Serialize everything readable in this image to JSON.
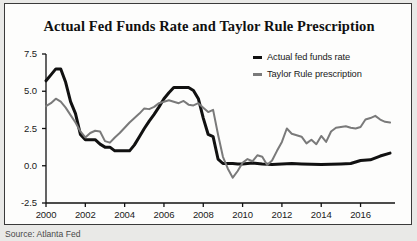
{
  "figure": {
    "title": "Actual Fed Funds Rate and Taylor Rule Prescription",
    "source": "Source: Atlanta Fed",
    "background_color": "#e9e9e7",
    "panel_color": "#fdfdfc",
    "border_color": "#3a3a3a"
  },
  "legend": {
    "position": "top-right",
    "entries": [
      {
        "label": "Actual fed funds rate",
        "color": "#111111"
      },
      {
        "label": "Taylor Rule prescription",
        "color": "#7a7a7a"
      }
    ]
  },
  "chart_data": {
    "type": "line",
    "title": "Actual Fed Funds Rate and Taylor Rule Prescription",
    "xlabel": "",
    "ylabel": "",
    "xlim": [
      2000.0,
      2017.6
    ],
    "ylim": [
      -2.5,
      7.5
    ],
    "grid": false,
    "legend_position": "top-right",
    "xticks": [
      2000,
      2002,
      2004,
      2006,
      2008,
      2010,
      2012,
      2014,
      2016
    ],
    "xtick_labels": [
      "2000",
      "2002",
      "2004",
      "2006",
      "2008",
      "2010",
      "2012",
      "2014",
      "2016"
    ],
    "yticks": [
      -2.5,
      0.0,
      2.5,
      5.0,
      7.5
    ],
    "ytick_labels": [
      "-2.5",
      "0.0",
      "2.5",
      "5.0",
      "7.5"
    ],
    "series": [
      {
        "name": "Actual fed funds rate",
        "color": "#111111",
        "line_width": 3,
        "x": [
          2000.0,
          2000.25,
          2000.5,
          2000.75,
          2001.0,
          2001.25,
          2001.5,
          2001.75,
          2002.0,
          2002.25,
          2002.5,
          2002.75,
          2003.0,
          2003.25,
          2003.5,
          2003.75,
          2004.0,
          2004.25,
          2004.5,
          2004.75,
          2005.0,
          2005.25,
          2005.5,
          2005.75,
          2006.0,
          2006.25,
          2006.5,
          2006.75,
          2007.0,
          2007.25,
          2007.5,
          2007.75,
          2008.0,
          2008.25,
          2008.5,
          2008.75,
          2009.0,
          2009.25,
          2009.5,
          2009.75,
          2010.0,
          2010.5,
          2011.0,
          2011.5,
          2012.0,
          2012.5,
          2013.0,
          2013.5,
          2014.0,
          2014.5,
          2015.0,
          2015.5,
          2016.0,
          2016.5,
          2017.0,
          2017.5
        ],
        "y": [
          5.7,
          6.1,
          6.5,
          6.5,
          5.6,
          4.3,
          3.5,
          2.1,
          1.75,
          1.75,
          1.75,
          1.45,
          1.25,
          1.25,
          1.0,
          1.0,
          1.0,
          1.0,
          1.4,
          1.95,
          2.5,
          3.0,
          3.45,
          3.95,
          4.5,
          4.9,
          5.25,
          5.25,
          5.25,
          5.25,
          5.05,
          4.5,
          3.2,
          2.1,
          1.95,
          0.45,
          0.15,
          0.15,
          0.15,
          0.12,
          0.12,
          0.18,
          0.12,
          0.08,
          0.12,
          0.15,
          0.12,
          0.1,
          0.08,
          0.1,
          0.12,
          0.15,
          0.35,
          0.4,
          0.65,
          0.85
        ]
      },
      {
        "name": "Taylor Rule prescription",
        "color": "#7a7a7a",
        "line_width": 2,
        "x": [
          2000.0,
          2000.25,
          2000.5,
          2000.75,
          2001.0,
          2001.25,
          2001.5,
          2001.75,
          2002.0,
          2002.25,
          2002.5,
          2002.75,
          2003.0,
          2003.25,
          2003.5,
          2003.75,
          2004.0,
          2004.25,
          2004.5,
          2004.75,
          2005.0,
          2005.25,
          2005.5,
          2005.75,
          2006.0,
          2006.25,
          2006.5,
          2006.75,
          2007.0,
          2007.25,
          2007.5,
          2007.75,
          2008.0,
          2008.25,
          2008.5,
          2008.75,
          2009.0,
          2009.25,
          2009.5,
          2009.75,
          2010.0,
          2010.25,
          2010.5,
          2010.75,
          2011.0,
          2011.25,
          2011.5,
          2011.75,
          2012.0,
          2012.25,
          2012.5,
          2012.75,
          2013.0,
          2013.25,
          2013.5,
          2013.75,
          2014.0,
          2014.25,
          2014.5,
          2014.75,
          2015.0,
          2015.25,
          2015.5,
          2015.75,
          2016.0,
          2016.25,
          2016.5,
          2016.75,
          2017.0,
          2017.25,
          2017.5
        ],
        "y": [
          4.0,
          4.2,
          4.5,
          4.3,
          3.9,
          3.4,
          2.9,
          2.3,
          1.9,
          2.2,
          2.35,
          2.3,
          1.65,
          1.55,
          1.9,
          2.2,
          2.55,
          2.9,
          3.2,
          3.5,
          3.85,
          3.8,
          3.95,
          4.2,
          4.3,
          4.4,
          4.3,
          4.2,
          4.35,
          4.1,
          4.05,
          4.2,
          3.9,
          3.6,
          3.75,
          2.1,
          0.6,
          -0.2,
          -0.8,
          -0.35,
          0.2,
          0.45,
          0.3,
          0.7,
          0.6,
          0.05,
          0.35,
          1.0,
          1.6,
          2.5,
          2.15,
          2.05,
          1.95,
          1.5,
          1.75,
          1.45,
          2.0,
          1.6,
          2.3,
          2.55,
          2.6,
          2.65,
          2.55,
          2.5,
          2.6,
          3.1,
          3.2,
          3.35,
          3.1,
          2.95,
          2.9
        ]
      }
    ]
  }
}
